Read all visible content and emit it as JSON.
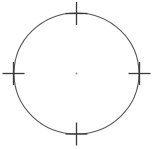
{
  "figure": {
    "type": "technical-line-drawing",
    "canvas": {
      "width": 153,
      "height": 149,
      "background_color": "#ffffff"
    },
    "stroke": {
      "color": "#555555",
      "dark_color": "#3a3a3a",
      "width": 1.1,
      "tick_width": 1.3
    },
    "circle": {
      "center_x": 76.5,
      "center_y": 73.5,
      "radius_x": 62.5,
      "radius_y": 60.5,
      "label": "main-circle"
    },
    "center_point": {
      "x": 76.5,
      "y": 73.5,
      "radius": 0.9,
      "color": "#8a8a8a",
      "label": "center-dot"
    },
    "ticks": [
      {
        "id": "tick-north",
        "position": "north",
        "cx": 76.5,
        "cy": 13.5,
        "h_half_length": 11,
        "v_half_length": 11.5
      },
      {
        "id": "tick-east",
        "position": "east",
        "cx": 139.5,
        "cy": 73.5,
        "h_half_length": 11,
        "v_half_length": 11.5
      },
      {
        "id": "tick-south",
        "position": "south",
        "cx": 76.5,
        "cy": 134.0,
        "h_half_length": 11,
        "v_half_length": 11.5
      },
      {
        "id": "tick-west",
        "position": "west",
        "cx": 13.5,
        "cy": 73.5,
        "h_half_length": 11,
        "v_half_length": 11.5
      }
    ]
  }
}
